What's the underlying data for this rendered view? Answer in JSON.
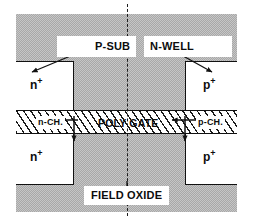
{
  "figure": {
    "colors": {
      "substrate_gray": "#b4b4b4",
      "line_black": "#111111",
      "fill_white": "#ffffff"
    }
  },
  "labels": {
    "p_sub": "P-SUB",
    "n_well": "N-WELL",
    "poly_gate": "POLY GATE",
    "field_oxide": "FIELD OXIDE",
    "n_channel": "n-CH.",
    "p_channel": "p-CH.",
    "n_plus_top": "n",
    "n_plus_top_sup": "+",
    "p_plus_top": "p",
    "p_plus_top_sup": "+",
    "n_plus_bottom": "n",
    "n_plus_bottom_sup": "+",
    "p_plus_bottom": "p",
    "p_plus_bottom_sup": "+"
  }
}
